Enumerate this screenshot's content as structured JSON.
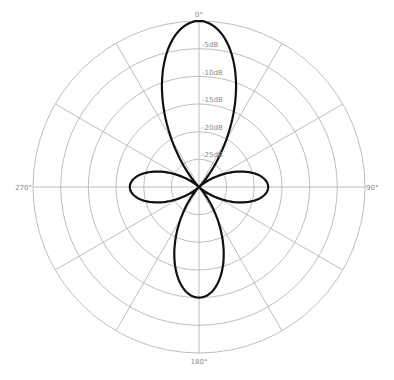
{
  "chart_data": {
    "type": "polar",
    "title": "",
    "subtitle": "",
    "angle_labels": [
      {
        "angle": 0,
        "label": "0°"
      },
      {
        "angle": 90,
        "label": "90°"
      },
      {
        "angle": 180,
        "label": "180°"
      },
      {
        "angle": 270,
        "label": "270°"
      }
    ],
    "radial_labels": [
      "-5dB",
      "-10dB",
      "-15dB",
      "-20dB",
      "-25dB"
    ],
    "radial_range_db": [
      -30,
      0
    ],
    "ring_step_db": 5,
    "spoke_step_deg": 30,
    "grid": true,
    "legend": "none",
    "series": [
      {
        "name": "polar pattern",
        "description": "Multi-lobe pickup pattern: main front lobe to 0dB, rear lobe, two side lobes, nulls at ±45° and ±135°",
        "lobes": [
          {
            "direction_deg": 0,
            "peak_db": 0
          },
          {
            "direction_deg": 180,
            "peak_db": -10
          },
          {
            "direction_deg": 90,
            "peak_db": -17.5
          },
          {
            "direction_deg": 270,
            "peak_db": -17.5
          }
        ]
      }
    ]
  }
}
